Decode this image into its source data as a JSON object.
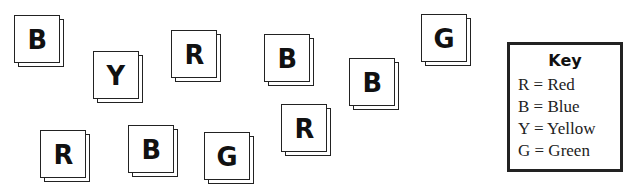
{
  "tiles": [
    {
      "letter": "B",
      "x": 14,
      "y": 15
    },
    {
      "letter": "Y",
      "x": 93,
      "y": 51
    },
    {
      "letter": "R",
      "x": 171,
      "y": 30
    },
    {
      "letter": "B",
      "x": 264,
      "y": 34
    },
    {
      "letter": "B",
      "x": 349,
      "y": 58
    },
    {
      "letter": "G",
      "x": 421,
      "y": 14
    },
    {
      "letter": "R",
      "x": 40,
      "y": 130
    },
    {
      "letter": "B",
      "x": 128,
      "y": 125
    },
    {
      "letter": "G",
      "x": 204,
      "y": 132
    },
    {
      "letter": "R",
      "x": 281,
      "y": 104
    }
  ],
  "key": {
    "title": "Key",
    "entries": [
      {
        "code": "R",
        "meaning": "Red",
        "text": "R = Red"
      },
      {
        "code": "B",
        "meaning": "Blue",
        "text": "B = Blue"
      },
      {
        "code": "Y",
        "meaning": "Yellow",
        "text": "Y = Yellow"
      },
      {
        "code": "G",
        "meaning": "Green",
        "text": "G = Green"
      }
    ]
  }
}
